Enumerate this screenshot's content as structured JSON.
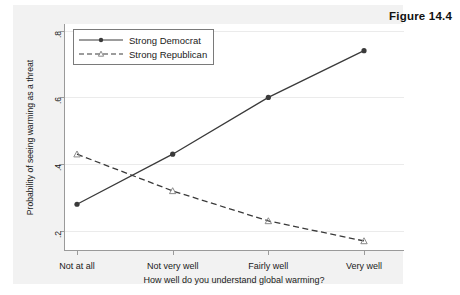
{
  "figure": {
    "caption": "Figure 14.4"
  },
  "chart_data": {
    "type": "line",
    "title": "",
    "xlabel": "How well do you understand global warming?",
    "ylabel": "Probability of seeing warming as a threat",
    "categories": [
      "Not at all",
      "Not very well",
      "Fairly well",
      "Very well"
    ],
    "yticks": [
      0.2,
      0.4,
      0.6,
      0.8
    ],
    "ytick_labels": [
      ".2",
      ".4",
      ".6",
      ".8"
    ],
    "ylim": [
      0.14,
      0.82
    ],
    "grid": true,
    "legend_position": "upper-left-inside",
    "series": [
      {
        "name": "Strong Democrat",
        "values": [
          0.28,
          0.43,
          0.6,
          0.74
        ],
        "line_style": "solid",
        "marker": "circle",
        "color": "#3a3a3a"
      },
      {
        "name": "Strong Republican",
        "values": [
          0.43,
          0.32,
          0.23,
          0.17
        ],
        "line_style": "dashed",
        "marker": "triangle",
        "color": "#3a3a3a"
      }
    ]
  }
}
